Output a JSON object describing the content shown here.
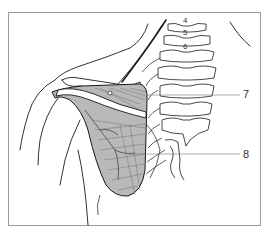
{
  "figure": {
    "vertebra_labels": [
      {
        "text": "4",
        "x": 183,
        "y": 17
      },
      {
        "text": "5",
        "x": 183,
        "y": 29
      },
      {
        "text": "6",
        "x": 183,
        "y": 43
      }
    ],
    "callouts": [
      {
        "text": "7",
        "x": 243,
        "y": 89,
        "line_from": [
          147,
          95
        ],
        "line_to": [
          240,
          95
        ]
      },
      {
        "text": "8",
        "x": 243,
        "y": 149,
        "line_from": [
          128,
          154
        ],
        "line_to": [
          240,
          154
        ]
      }
    ],
    "colors": {
      "line": "#1a1a1a",
      "muscle_fill": "#b9b9b9",
      "frame": "#9a9a9a",
      "leader": "#777777"
    }
  }
}
